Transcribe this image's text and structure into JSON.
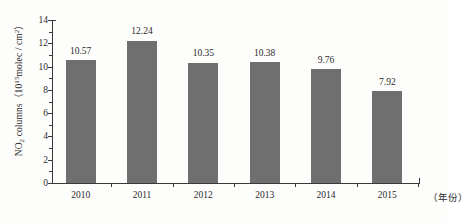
{
  "chart_data": {
    "type": "bar",
    "title": "",
    "subtitle": "",
    "xlabel": "（年份）",
    "ylabel_parts": {
      "species": "NO",
      "species_sub": "2",
      "word": " columns",
      "open_paren": "（",
      "base": "10",
      "exponent": "15",
      "unit": "molec / cm",
      "unit_exponent": "2",
      "close_paren": "）"
    },
    "ylabel": "NO2 columns（10^15 molec / cm^2）",
    "categories": [
      "2010",
      "2011",
      "2012",
      "2013",
      "2014",
      "2015"
    ],
    "values": [
      10.57,
      12.24,
      10.35,
      10.38,
      9.76,
      7.92
    ],
    "value_labels": [
      "10.57",
      "12.24",
      "10.35",
      "10.38",
      "9.76",
      "7.92"
    ],
    "ylim": [
      0,
      14
    ],
    "ytick_labels": [
      "0",
      "2",
      "4",
      "6",
      "8",
      "10",
      "12",
      "14"
    ],
    "ytick_values": [
      0,
      2,
      4,
      6,
      8,
      10,
      12,
      14
    ],
    "yminor_values": [
      1,
      3,
      5,
      7,
      9,
      11,
      13
    ],
    "grid": false,
    "legend": false,
    "bar_color": "#6f6f6f",
    "axis_color": "#3a3a3a",
    "background_color": "#fdfdfc"
  }
}
